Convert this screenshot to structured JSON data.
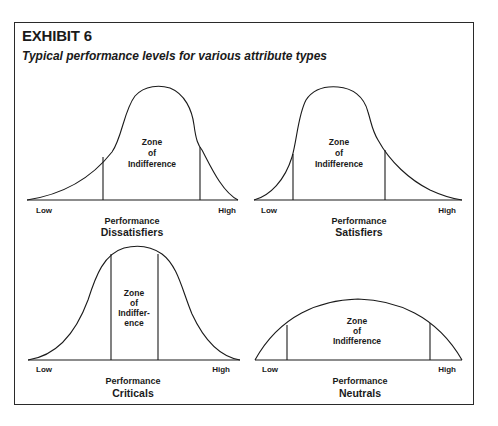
{
  "header": {
    "title": "EXHIBIT 6",
    "subtitle": "Typical performance levels for various attribute types"
  },
  "panels": [
    {
      "id": "dissatisfiers",
      "zone_lines": [
        "Zone",
        "of",
        "Indifference"
      ],
      "axis_low": "Low",
      "axis_high": "High",
      "axis_label": "Performance",
      "type_label": "Dissatisfiers"
    },
    {
      "id": "satisfiers",
      "zone_lines": [
        "Zone",
        "of",
        "Indifference"
      ],
      "axis_low": "Low",
      "axis_high": "High",
      "axis_label": "Performance",
      "type_label": "Satisfiers"
    },
    {
      "id": "criticals",
      "zone_lines": [
        "Zone",
        "of",
        "Indiffer-",
        "ence"
      ],
      "axis_low": "Low",
      "axis_high": "High",
      "axis_label": "Performance",
      "type_label": "Criticals"
    },
    {
      "id": "neutrals",
      "zone_lines": [
        "Zone",
        "of",
        "Indifference"
      ],
      "axis_low": "Low",
      "axis_high": "High",
      "axis_label": "Performance",
      "type_label": "Neutrals"
    }
  ],
  "colors": {
    "ink": "#1a1a1a",
    "background": "#ffffff"
  }
}
